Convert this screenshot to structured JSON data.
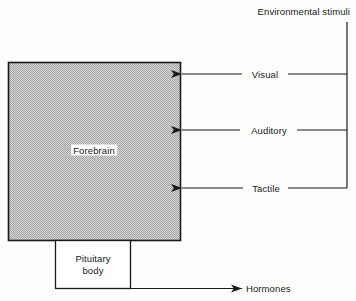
{
  "diagram": {
    "title": "Environmental stimuli",
    "blocks": [
      {
        "id": "forebrain",
        "label": "Forebrain",
        "fill": "#c2c2c2",
        "stroke": "#1a1a1a"
      },
      {
        "id": "pituitary",
        "label_line1": "Pituitary",
        "label_line2": "body",
        "fill": "#ffffff",
        "stroke": "#1a1a1a"
      }
    ],
    "inputs": [
      {
        "id": "visual",
        "label": "Visual"
      },
      {
        "id": "auditory",
        "label": "Auditory"
      },
      {
        "id": "tactile",
        "label": "Tactile"
      }
    ],
    "outputs": [
      {
        "id": "hormones",
        "label": "Hormones"
      }
    ],
    "colors": {
      "ink": "#1a1a1a",
      "shaded_block": "#c2c2c2",
      "paper": "#fdfdfb"
    }
  }
}
